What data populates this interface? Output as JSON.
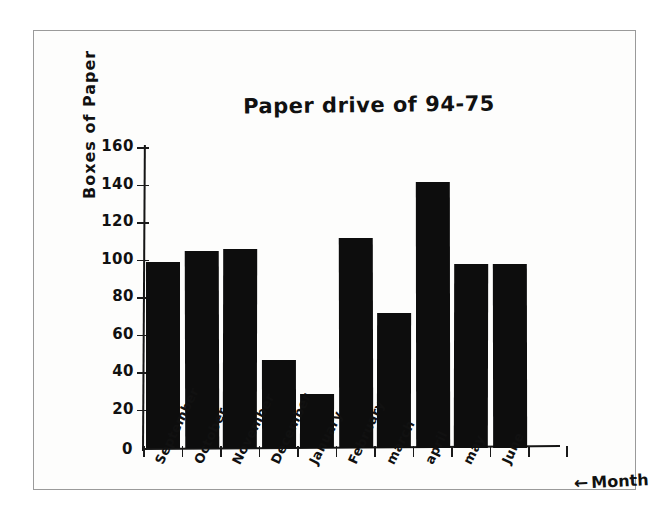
{
  "page": {
    "background_color": "#ffffff",
    "paper_color": "#fdfdfc",
    "border_color": "#9a9a9a",
    "ink_color": "#111111"
  },
  "chart_data": {
    "type": "bar",
    "title": "Paper drive of 94-75",
    "xlabel": "Month",
    "ylabel": "Boxes of Paper",
    "categories": [
      "September",
      "October",
      "November",
      "December",
      "January",
      "February",
      "march",
      "april",
      "may",
      "June"
    ],
    "values": [
      99,
      105,
      106,
      47,
      29,
      112,
      72,
      142,
      98,
      98
    ],
    "ylim": [
      0,
      160
    ],
    "yticks": [
      20,
      40,
      60,
      80,
      100,
      120,
      140,
      160
    ],
    "ytick_labels": [
      "20",
      "40",
      "60",
      "80",
      "100",
      "120",
      "140",
      "160"
    ],
    "zero_label": "0",
    "grid": false,
    "legend": false,
    "bar_color": "#0d0d0d",
    "axis_annotation": "Month",
    "axis_annotation_arrow": "←"
  }
}
